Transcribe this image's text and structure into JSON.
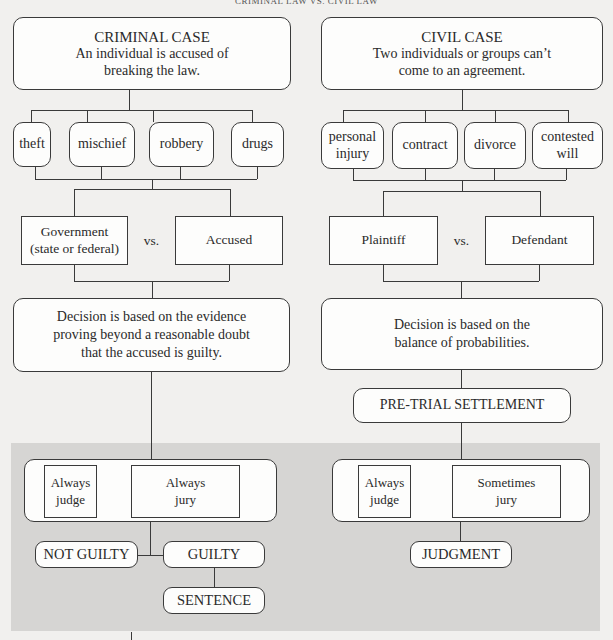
{
  "header": {
    "title": "CRIMINAL LAW VS. CIVIL LAW"
  },
  "criminal": {
    "heading": "CRIMINAL CASE",
    "description_line1": "An individual is accused of",
    "description_line2": "breaking the law.",
    "categories": [
      "theft",
      "mischief",
      "robbery",
      "drugs"
    ],
    "party_left_line1": "Government",
    "party_left_line2": "(state or federal)",
    "vs": "vs.",
    "party_right": "Accused",
    "decision_line1": "Decision is based on the evidence",
    "decision_line2": "proving beyond a reasonable doubt",
    "decision_line3": "that the accused is guilty.",
    "trial": {
      "judge_line1": "Always",
      "judge_line2": "judge",
      "jury_line1": "Always",
      "jury_line2": "jury"
    },
    "outcomes": {
      "not_guilty": "NOT GUILTY",
      "guilty": "GUILTY",
      "sentence": "SENTENCE"
    }
  },
  "civil": {
    "heading": "CIVIL CASE",
    "description_line1": "Two individuals or groups can’t",
    "description_line2": "come to an agreement.",
    "categories": [
      {
        "line1": "personal",
        "line2": "injury"
      },
      {
        "line1": "contract",
        "line2": ""
      },
      {
        "line1": "divorce",
        "line2": ""
      },
      {
        "line1": "contested",
        "line2": "will"
      }
    ],
    "party_left": "Plaintiff",
    "vs": "vs.",
    "party_right": "Defendant",
    "decision_line1": "Decision is based on the",
    "decision_line2": "balance of probabilities.",
    "pretrial": "PRE-TRIAL SETTLEMENT",
    "trial": {
      "judge_line1": "Always",
      "judge_line2": "judge",
      "jury_line1": "Sometimes",
      "jury_line2": "jury"
    },
    "outcomes": {
      "judgment": "JUDGMENT"
    }
  },
  "colors": {
    "background": "#f1f0ee",
    "trial_region": "#d6d5d3",
    "box_fill": "#fdfdfc",
    "line": "#3a3a3a"
  }
}
